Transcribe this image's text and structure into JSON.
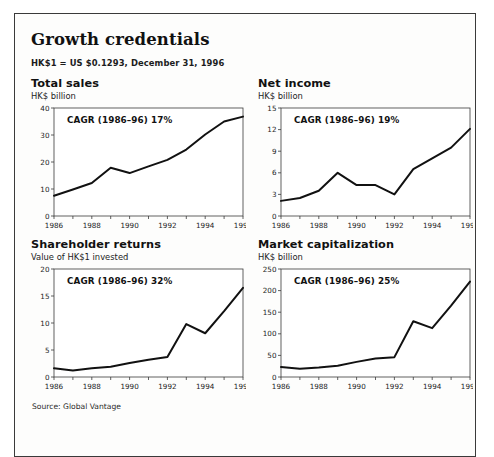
{
  "exhibit": {
    "title": "Growth credentials",
    "subtitle": "HK$1 = US $0.1293, December 31, 1996",
    "source": "Source: Global Vantage",
    "border_color": "#3a3a3a",
    "line_color": "#111111"
  },
  "chart_data": [
    {
      "type": "line",
      "title": "Total sales",
      "ylabel": "HK$ billion",
      "annotation": "CAGR (1986–96) 17%",
      "xlabel": "",
      "grid": false,
      "legend": "none",
      "x": [
        1986,
        1987,
        1988,
        1989,
        1990,
        1991,
        1992,
        1993,
        1994,
        1995,
        1996
      ],
      "xticks": [
        "1986",
        "1988",
        "1990",
        "1992",
        "1994",
        "1996"
      ],
      "yticks": [
        "0",
        "10",
        "20",
        "30",
        "40"
      ],
      "ylim": [
        0,
        40
      ],
      "xlim": [
        1986,
        1996
      ],
      "values": [
        7.5,
        9.8,
        12.2,
        17.9,
        15.9,
        18.4,
        20.8,
        24.6,
        30.2,
        35.0,
        36.8
      ]
    },
    {
      "type": "line",
      "title": "Net income",
      "ylabel": "HK$ billion",
      "annotation": "CAGR (1986–96) 19%",
      "xlabel": "",
      "grid": false,
      "legend": "none",
      "x": [
        1986,
        1987,
        1988,
        1989,
        1990,
        1991,
        1992,
        1993,
        1994,
        1995,
        1996
      ],
      "xticks": [
        "1986",
        "1988",
        "1990",
        "1992",
        "1994",
        "1996"
      ],
      "yticks": [
        "0",
        "3",
        "6",
        "9",
        "12",
        "15"
      ],
      "ylim": [
        0,
        15
      ],
      "xlim": [
        1986,
        1996
      ],
      "values": [
        2.1,
        2.5,
        3.5,
        6.0,
        4.3,
        4.3,
        3.0,
        6.5,
        8.0,
        9.5,
        12.1
      ]
    },
    {
      "type": "line",
      "title": "Shareholder returns",
      "ylabel": "Value of HK$1 invested",
      "annotation": "CAGR (1986–96) 32%",
      "xlabel": "",
      "grid": false,
      "legend": "none",
      "x": [
        1986,
        1987,
        1988,
        1989,
        1990,
        1991,
        1992,
        1993,
        1994,
        1995,
        1996
      ],
      "xticks": [
        "1986",
        "1988",
        "1990",
        "1992",
        "1994",
        "1996"
      ],
      "yticks": [
        "0",
        "5",
        "10",
        "15",
        "20"
      ],
      "ylim": [
        0,
        20
      ],
      "xlim": [
        1986,
        1996
      ],
      "values": [
        1.6,
        1.2,
        1.6,
        1.9,
        2.6,
        3.2,
        3.7,
        9.8,
        8.1,
        12.2,
        16.5
      ]
    },
    {
      "type": "line",
      "title": "Market capitalization",
      "ylabel": "HK$ billion",
      "annotation": "CAGR (1986–96) 25%",
      "xlabel": "",
      "grid": false,
      "legend": "none",
      "x": [
        1986,
        1987,
        1988,
        1989,
        1990,
        1991,
        1992,
        1993,
        1994,
        1995,
        1996
      ],
      "xticks": [
        "1986",
        "1988",
        "1990",
        "1992",
        "1994",
        "1996"
      ],
      "yticks": [
        "0",
        "50",
        "100",
        "150",
        "200",
        "250"
      ],
      "ylim": [
        0,
        250
      ],
      "xlim": [
        1986,
        1996
      ],
      "values": [
        23,
        19,
        22,
        26,
        35,
        43,
        46,
        129,
        113,
        165,
        221
      ]
    }
  ]
}
